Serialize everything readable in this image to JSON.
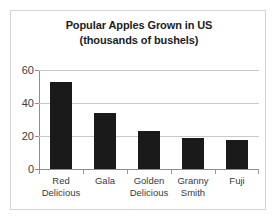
{
  "chart_data": {
    "type": "bar",
    "title": "Popular Apples Grown in US (thousands of bushels)",
    "title_lines": [
      "Popular Apples Grown in US",
      "(thousands of bushels)"
    ],
    "categories": [
      "Red Delicious",
      "Gala",
      "Golden Delicious",
      "Granny Smith",
      "Fuji"
    ],
    "category_lines": [
      [
        "Red",
        "Delicious"
      ],
      [
        "Gala",
        ""
      ],
      [
        "Golden",
        "Delicious"
      ],
      [
        "Granny",
        "Smith"
      ],
      [
        "Fuji",
        ""
      ]
    ],
    "values": [
      53,
      34,
      23,
      18.5,
      17.5
    ],
    "xlabel": "",
    "ylabel": "",
    "ylim": [
      0,
      60
    ],
    "yticks": [
      0,
      20,
      40,
      60
    ],
    "ytick_labels": [
      "0",
      "20",
      "40",
      "60"
    ],
    "grid": "horizontal",
    "legend": "none",
    "bar_color": "#1a1a1a",
    "gridline_color": "#c9c9c9",
    "axis_color": "#8d8d8d",
    "background_color": "#ffffff",
    "border_color": "#d4d4d4"
  }
}
